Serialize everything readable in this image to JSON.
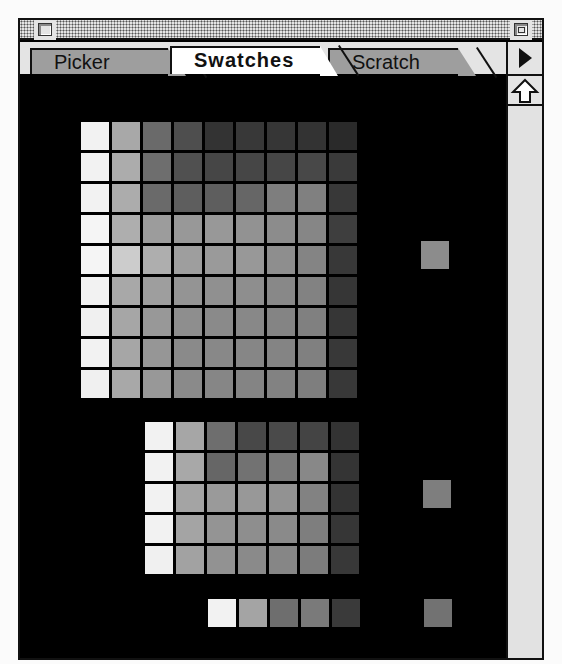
{
  "window": {
    "title_bar": {
      "close_box": "close-box",
      "zoom_box": "zoom-box"
    },
    "tabs": [
      {
        "label": "Picker",
        "active": false
      },
      {
        "label": "Swatches",
        "active": true
      },
      {
        "label": "Scratch",
        "active": false
      }
    ],
    "palette_menu_icon": "right-triangle-icon",
    "scroll_up_icon": "up-arrow-icon"
  },
  "swatches": {
    "grid_main": [
      [
        "#f2f2f2",
        "#a8a8a8",
        "#6a6a6a",
        "#4e4e4e",
        "#333333",
        "#383838",
        "#363636",
        "#333333",
        "#2a2a2a"
      ],
      [
        "#f2f2f2",
        "#acacac",
        "#6e6e6e",
        "#505050",
        "#464646",
        "#464646",
        "#464646",
        "#484848",
        "#3a3a3a"
      ],
      [
        "#f2f2f2",
        "#acacac",
        "#6a6a6a",
        "#5e5e5e",
        "#5e5e5e",
        "#666666",
        "#7e7e7e",
        "#808080",
        "#383838"
      ],
      [
        "#f5f5f5",
        "#aeaeae",
        "#9c9c9c",
        "#989898",
        "#989898",
        "#929292",
        "#8c8c8c",
        "#868686",
        "#3e3e3e"
      ],
      [
        "#f5f5f5",
        "#cccccc",
        "#aeaeae",
        "#9e9e9e",
        "#9a9a9a",
        "#989898",
        "#8e8e8e",
        "#848484",
        "#383838"
      ],
      [
        "#f2f2f2",
        "#a8a8a8",
        "#9e9e9e",
        "#949494",
        "#909090",
        "#8e8e8e",
        "#888888",
        "#828282",
        "#363636"
      ],
      [
        "#f0f0f0",
        "#a6a6a6",
        "#989898",
        "#8e8e8e",
        "#8a8a8a",
        "#888888",
        "#848484",
        "#808080",
        "#363636"
      ],
      [
        "#f2f2f2",
        "#a6a6a6",
        "#969696",
        "#8a8a8a",
        "#888888",
        "#868686",
        "#848484",
        "#808080",
        "#383838"
      ],
      [
        "#f0f0f0",
        "#a8a8a8",
        "#989898",
        "#8a8a8a",
        "#868686",
        "#848484",
        "#828282",
        "#7e7e7e",
        "#383838"
      ]
    ],
    "grid_secondary": [
      [
        "#f2f2f2",
        "#a6a6a6",
        "#6e6e6e",
        "#484848",
        "#4a4a4a",
        "#444444",
        "#333333"
      ],
      [
        "#f2f2f2",
        "#a8a8a8",
        "#666666",
        "#727272",
        "#7a7a7a",
        "#888888",
        "#343434"
      ],
      [
        "#f2f2f2",
        "#a4a4a4",
        "#9a9a9a",
        "#989898",
        "#929292",
        "#828282",
        "#333333"
      ],
      [
        "#f2f2f2",
        "#a4a4a4",
        "#949494",
        "#8e8e8e",
        "#8a8a8a",
        "#7e7e7e",
        "#363636"
      ],
      [
        "#f0f0f0",
        "#a2a2a2",
        "#929292",
        "#8a8a8a",
        "#868686",
        "#7c7c7c",
        "#383838"
      ]
    ],
    "row_bottom": [
      "#f2f2f2",
      "#a4a4a4",
      "#6e6e6e",
      "#7a7a7a",
      "#3a3a3a"
    ],
    "singles": [
      "#8c8c8c",
      "#7e7e7e",
      "#727272"
    ]
  }
}
